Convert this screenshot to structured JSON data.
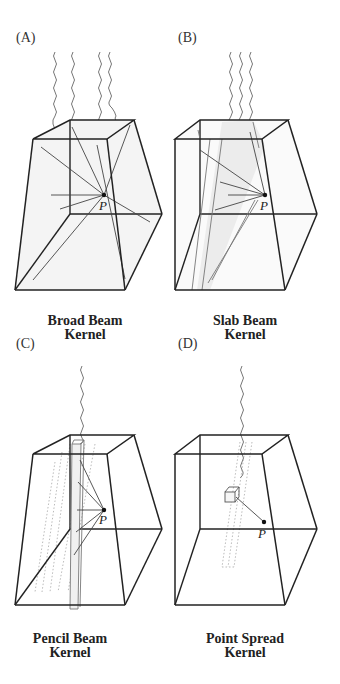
{
  "figure": {
    "panels": [
      {
        "id": "A",
        "letter": "(A)",
        "caption_line1": "Broad Beam",
        "caption_line2": "Kernel",
        "point_label": "P"
      },
      {
        "id": "B",
        "letter": "(B)",
        "caption_line1": "Slab Beam",
        "caption_line2": "Kernel",
        "point_label": "P"
      },
      {
        "id": "C",
        "letter": "(C)",
        "caption_line1": "Pencil Beam",
        "caption_line2": "Kernel",
        "point_label": "P"
      },
      {
        "id": "D",
        "letter": "(D)",
        "caption_line1": "Point Spread",
        "caption_line2": "Kernel",
        "point_label": "P"
      }
    ],
    "colors": {
      "edge": "#222222",
      "ray": "#555555",
      "dotted": "#aaaaaa",
      "fill": "#f2f2f2"
    }
  }
}
